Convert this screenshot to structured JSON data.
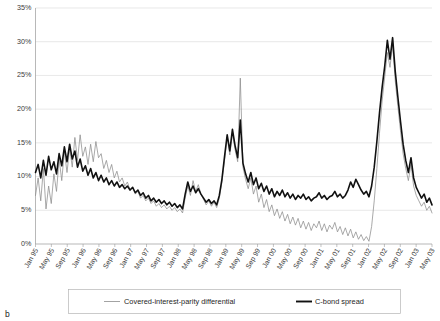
{
  "figure": {
    "panel_label": "b"
  },
  "legend": {
    "entries": [
      {
        "label": "Covered-interest-parity differential",
        "color": "#8c8c8c",
        "style": "thin"
      },
      {
        "label": "C-bond spread",
        "color": "#111111",
        "style": "thick"
      }
    ]
  },
  "chart_data": {
    "type": "line",
    "title": "",
    "xlabel": "",
    "ylabel": "",
    "ylim": [
      0,
      35
    ],
    "ytick_labels": [
      "0%",
      "5%",
      "10%",
      "15%",
      "20%",
      "25%",
      "30%",
      "35%"
    ],
    "ytick_values": [
      0,
      5,
      10,
      15,
      20,
      25,
      30,
      35
    ],
    "grid": true,
    "legend_position": "bottom",
    "x_tick_labels": [
      "Jan 95",
      "May 95",
      "Sep 95",
      "Jan 96",
      "May 96",
      "Sep 96",
      "Jan 97",
      "May 97",
      "Sep 97",
      "Jan 98",
      "May 98",
      "Sep 98",
      "Jan 99",
      "May 99",
      "Sep 99",
      "Jan 00",
      "May 00",
      "Sep 00",
      "Jan 01",
      "May 01",
      "Sep 01",
      "Jan 02",
      "May 02",
      "Sep 02",
      "Jan 03",
      "May 03"
    ],
    "x_tick_positions": [
      0,
      4,
      8,
      12,
      16,
      20,
      24,
      28,
      32,
      36,
      40,
      44,
      48,
      52,
      56,
      60,
      64,
      68,
      72,
      76,
      80,
      84,
      88,
      92,
      96,
      100
    ],
    "x_months_total": 101,
    "series": [
      {
        "name": "Covered-interest-parity differential",
        "color": "#8c8c8c",
        "values": [
          7.2,
          9.8,
          6.4,
          11.2,
          5.2,
          8.6,
          6.0,
          10.4,
          7.8,
          12.6,
          9.4,
          13.8,
          10.6,
          14.2,
          11.4,
          15.8,
          12.4,
          16.2,
          13.0,
          14.4,
          11.8,
          14.8,
          12.2,
          15.2,
          12.8,
          13.4,
          11.2,
          12.4,
          10.6,
          11.8,
          9.8,
          10.8,
          9.2,
          9.8,
          8.6,
          9.2,
          8.0,
          8.4,
          7.4,
          7.8,
          6.8,
          7.2,
          6.4,
          6.8,
          6.0,
          6.4,
          5.6,
          6.0,
          5.4,
          5.8,
          5.2,
          5.6,
          5.0,
          5.4,
          4.8,
          5.2,
          4.6,
          6.8,
          8.6,
          7.2,
          9.4,
          7.8,
          8.8,
          7.4,
          6.6,
          5.8,
          6.4,
          5.6,
          6.2,
          5.4,
          6.8,
          9.2,
          12.4,
          15.8,
          13.2,
          16.4,
          14.0,
          12.2,
          24.6,
          11.4,
          9.6,
          8.2,
          9.8,
          7.4,
          8.6,
          6.2,
          7.4,
          5.4,
          6.6,
          4.8,
          5.8,
          4.2,
          5.2,
          3.8,
          4.8,
          3.4,
          4.4,
          3.0,
          4.0,
          2.8,
          3.8,
          2.4,
          3.4,
          2.2,
          3.2,
          2.0,
          3.0,
          2.4,
          3.4,
          2.0,
          3.0,
          1.8,
          2.8,
          2.2,
          3.2,
          1.8,
          2.6,
          1.4,
          2.4,
          1.2,
          2.2,
          0.9,
          1.8,
          0.7,
          1.4,
          0.5,
          1.1,
          0.4,
          2.6,
          6.4,
          11.2,
          16.4,
          21.2,
          24.8,
          28.4,
          26.2,
          29.6,
          24.2,
          20.4,
          16.8,
          13.4,
          11.2,
          9.4,
          11.8,
          8.6,
          7.2,
          6.4,
          5.6,
          6.2,
          5.0,
          5.6,
          4.6
        ]
      },
      {
        "name": "C-bond spread",
        "color": "#111111",
        "values": [
          10.6,
          11.8,
          9.8,
          12.4,
          10.2,
          13.0,
          11.0,
          12.2,
          10.4,
          13.4,
          11.6,
          14.4,
          12.2,
          14.8,
          12.6,
          13.8,
          11.4,
          12.6,
          10.8,
          11.6,
          10.2,
          11.2,
          9.8,
          10.6,
          9.4,
          10.2,
          9.2,
          9.8,
          8.8,
          9.4,
          8.6,
          9.2,
          8.4,
          8.8,
          8.2,
          8.6,
          8.0,
          8.4,
          7.6,
          8.0,
          7.2,
          7.6,
          6.8,
          7.2,
          6.4,
          6.8,
          6.2,
          6.6,
          6.0,
          6.4,
          5.8,
          6.2,
          5.6,
          6.0,
          5.4,
          5.8,
          5.2,
          7.4,
          9.2,
          7.8,
          8.6,
          7.6,
          8.2,
          7.4,
          6.8,
          6.2,
          6.6,
          6.0,
          6.4,
          5.8,
          7.2,
          9.6,
          13.0,
          16.2,
          13.8,
          17.0,
          14.6,
          12.8,
          18.4,
          12.0,
          10.4,
          9.2,
          10.6,
          8.8,
          9.8,
          8.2,
          9.0,
          7.8,
          8.6,
          7.4,
          8.2,
          7.0,
          7.8,
          7.2,
          8.0,
          7.0,
          7.6,
          6.8,
          7.4,
          6.6,
          7.2,
          6.8,
          7.4,
          6.6,
          7.0,
          6.4,
          6.8,
          7.0,
          7.6,
          6.8,
          7.2,
          6.6,
          7.0,
          7.2,
          7.8,
          7.0,
          7.4,
          6.8,
          7.2,
          8.0,
          9.2,
          8.4,
          9.6,
          8.8,
          8.0,
          7.4,
          7.8,
          7.0,
          8.6,
          11.4,
          15.2,
          19.4,
          23.2,
          26.4,
          30.2,
          27.4,
          30.6,
          25.6,
          21.8,
          18.2,
          14.8,
          12.4,
          10.6,
          12.8,
          9.8,
          8.4,
          7.6,
          6.8,
          7.4,
          6.2,
          6.8,
          5.8
        ]
      }
    ]
  }
}
